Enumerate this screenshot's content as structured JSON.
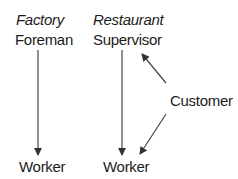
{
  "diagram": {
    "factory": {
      "heading": "Factory",
      "top_role": "Foreman",
      "bottom_role": "Worker"
    },
    "restaurant": {
      "heading": "Restaurant",
      "top_role": "Supervisor",
      "bottom_role": "Worker"
    },
    "external_actor": "Customer",
    "edges": [
      {
        "from": "Foreman",
        "to": "Worker (Factory)"
      },
      {
        "from": "Supervisor",
        "to": "Worker (Restaurant)"
      },
      {
        "from": "Customer",
        "to": "Supervisor"
      },
      {
        "from": "Customer",
        "to": "Worker (Restaurant)"
      }
    ],
    "colors": {
      "text": "#1c1c1c",
      "arrow": "#333333",
      "background": "#ffffff"
    }
  }
}
